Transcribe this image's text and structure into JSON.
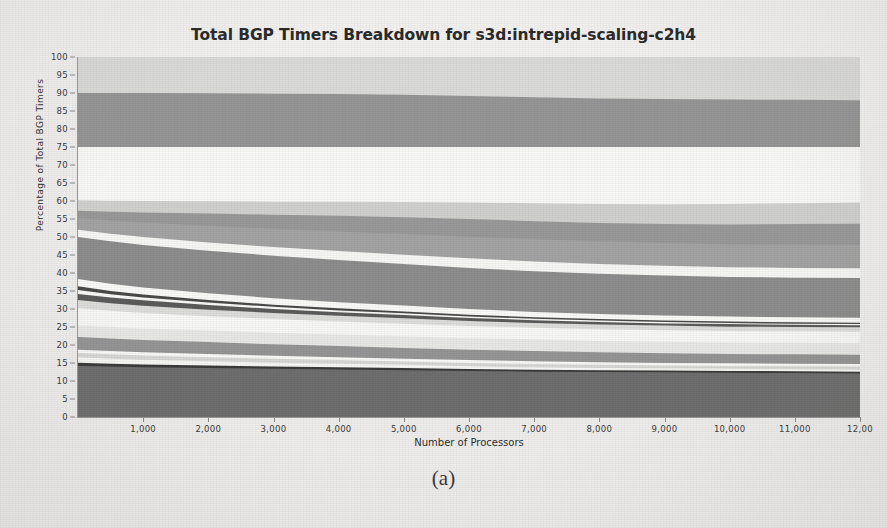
{
  "figure": {
    "caption": "(a)"
  },
  "chart_data": {
    "type": "area",
    "title": "Total BGP Timers Breakdown for s3d:intrepid-scaling-c2h4",
    "xlabel": "Number of Processors",
    "ylabel": "Percentage of Total BGP Timers",
    "xlim": [
      0,
      12000
    ],
    "ylim": [
      0,
      100
    ],
    "grid": false,
    "legend_position": "none",
    "stacked": true,
    "normalized_percent": true,
    "xticks": [
      {
        "value": 1000,
        "label": "1,000"
      },
      {
        "value": 2000,
        "label": "2,000"
      },
      {
        "value": 3000,
        "label": "3,000"
      },
      {
        "value": 4000,
        "label": "4,000"
      },
      {
        "value": 5000,
        "label": "5,000"
      },
      {
        "value": 6000,
        "label": "6,000"
      },
      {
        "value": 7000,
        "label": "7,000"
      },
      {
        "value": 8000,
        "label": "8,000"
      },
      {
        "value": 9000,
        "label": "9,000"
      },
      {
        "value": 10000,
        "label": "10,000"
      },
      {
        "value": 11000,
        "label": "11,000"
      },
      {
        "value": 12000,
        "label": "12,00"
      }
    ],
    "yticks": [
      {
        "value": 0,
        "label": "0"
      },
      {
        "value": 5,
        "label": "5"
      },
      {
        "value": 10,
        "label": "10"
      },
      {
        "value": 15,
        "label": "15"
      },
      {
        "value": 20,
        "label": "20"
      },
      {
        "value": 25,
        "label": "25"
      },
      {
        "value": 30,
        "label": "30"
      },
      {
        "value": 35,
        "label": "35"
      },
      {
        "value": 40,
        "label": "40"
      },
      {
        "value": 45,
        "label": "45"
      },
      {
        "value": 50,
        "label": "50"
      },
      {
        "value": 55,
        "label": "55"
      },
      {
        "value": 60,
        "label": "60"
      },
      {
        "value": 65,
        "label": "65"
      },
      {
        "value": 70,
        "label": "70"
      },
      {
        "value": 75,
        "label": "75"
      },
      {
        "value": 80,
        "label": "80"
      },
      {
        "value": 85,
        "label": "85"
      },
      {
        "value": 90,
        "label": "90"
      },
      {
        "value": 95,
        "label": "95"
      },
      {
        "value": 100,
        "label": "100"
      }
    ],
    "x": [
      0,
      500,
      1000,
      2000,
      3000,
      4000,
      5000,
      6000,
      7000,
      8000,
      9000,
      10000,
      11000,
      12000
    ],
    "series": [
      {
        "name": "band-01-bottom-dark",
        "color": "#6f6f6f",
        "cumulative_top": [
          14.2,
          14.0,
          13.8,
          13.6,
          13.4,
          13.2,
          13.0,
          12.8,
          12.6,
          12.5,
          12.4,
          12.3,
          12.2,
          12.1
        ]
      },
      {
        "name": "band-02-darkline",
        "color": "#3b3b3b",
        "cumulative_top": [
          15.1,
          14.8,
          14.6,
          14.3,
          14.0,
          13.8,
          13.6,
          13.3,
          13.1,
          13.0,
          12.9,
          12.8,
          12.7,
          12.6
        ]
      },
      {
        "name": "band-03-white",
        "color": "#f7f7f5",
        "cumulative_top": [
          16.6,
          16.2,
          15.9,
          15.5,
          15.1,
          14.8,
          14.5,
          14.1,
          13.8,
          13.6,
          13.5,
          13.4,
          13.3,
          13.2
        ]
      },
      {
        "name": "band-04-light",
        "color": "#d8d8d6",
        "cumulative_top": [
          17.8,
          17.4,
          17.1,
          16.6,
          16.2,
          15.8,
          15.4,
          15.0,
          14.7,
          14.5,
          14.3,
          14.2,
          14.1,
          14.0
        ]
      },
      {
        "name": "band-05-white",
        "color": "#fafaf8",
        "cumulative_top": [
          18.7,
          18.3,
          18.0,
          17.5,
          17.0,
          16.6,
          16.2,
          15.8,
          15.5,
          15.2,
          15.0,
          14.9,
          14.8,
          14.7
        ]
      },
      {
        "name": "band-06-medium",
        "color": "#969696",
        "cumulative_top": [
          22.2,
          21.8,
          21.4,
          20.8,
          20.2,
          19.7,
          19.2,
          18.7,
          18.3,
          18.0,
          17.7,
          17.5,
          17.4,
          17.3
        ]
      },
      {
        "name": "band-07-verylight",
        "color": "#e9e9e7",
        "cumulative_top": [
          25.4,
          25.0,
          24.6,
          24.0,
          23.4,
          22.9,
          22.4,
          21.9,
          21.5,
          21.2,
          20.9,
          20.7,
          20.6,
          20.5
        ]
      },
      {
        "name": "band-08-white",
        "color": "#f9f9f7",
        "cumulative_top": [
          30.2,
          29.5,
          28.9,
          28.0,
          27.2,
          26.5,
          25.9,
          25.3,
          24.8,
          24.4,
          24.1,
          23.9,
          23.8,
          23.7
        ]
      },
      {
        "name": "band-09-palegray",
        "color": "#dededc",
        "cumulative_top": [
          32.5,
          31.6,
          30.9,
          29.8,
          28.9,
          28.1,
          27.4,
          26.7,
          26.1,
          25.7,
          25.4,
          25.1,
          25.0,
          24.9
        ]
      },
      {
        "name": "band-10-darkthin",
        "color": "#5c5c5c",
        "cumulative_top": [
          34.2,
          33.2,
          32.4,
          31.1,
          30.0,
          29.1,
          28.3,
          27.5,
          26.9,
          26.4,
          26.0,
          25.8,
          25.6,
          25.5
        ]
      },
      {
        "name": "band-11-white",
        "color": "#fafaf8",
        "cumulative_top": [
          35.3,
          34.1,
          33.2,
          31.8,
          30.6,
          29.6,
          28.8,
          27.9,
          27.3,
          26.8,
          26.4,
          26.1,
          25.9,
          25.8
        ]
      },
      {
        "name": "band-12-darkline2",
        "color": "#4a4a4a",
        "cumulative_top": [
          36.3,
          35.0,
          34.0,
          32.5,
          31.2,
          30.2,
          29.3,
          28.4,
          27.7,
          27.2,
          26.8,
          26.5,
          26.3,
          26.2
        ]
      },
      {
        "name": "band-13-whiteband",
        "color": "#fbfbf9",
        "cumulative_top": [
          38.3,
          37.0,
          36.0,
          34.4,
          33.0,
          31.9,
          31.0,
          30.0,
          29.2,
          28.6,
          28.2,
          27.9,
          27.7,
          27.6
        ]
      },
      {
        "name": "band-14-bigmedium",
        "color": "#8e8e8e",
        "cumulative_top": [
          50.0,
          48.8,
          47.8,
          46.2,
          44.8,
          43.6,
          42.5,
          41.4,
          40.5,
          39.8,
          39.3,
          38.9,
          38.7,
          38.6
        ]
      },
      {
        "name": "band-15-white",
        "color": "#f8f8f6",
        "cumulative_top": [
          52.0,
          50.9,
          50.0,
          48.5,
          47.2,
          46.1,
          45.1,
          44.1,
          43.2,
          42.5,
          42.0,
          41.6,
          41.4,
          41.3
        ]
      },
      {
        "name": "band-16-medgray",
        "color": "#a4a4a4",
        "cumulative_top": [
          55.3,
          54.6,
          54.0,
          53.1,
          52.3,
          51.5,
          50.8,
          50.1,
          49.4,
          48.8,
          48.3,
          48.0,
          47.9,
          47.8
        ]
      },
      {
        "name": "band-17-medgray2",
        "color": "#9a9a9a",
        "cumulative_top": [
          57.3,
          57.0,
          56.8,
          56.5,
          56.2,
          55.9,
          55.5,
          55.0,
          54.4,
          53.9,
          53.6,
          53.5,
          53.6,
          53.7
        ]
      },
      {
        "name": "band-18-lightgray",
        "color": "#d2d2d0",
        "cumulative_top": [
          60.2,
          60.1,
          60.0,
          59.9,
          59.8,
          59.8,
          59.7,
          59.6,
          59.4,
          59.2,
          59.1,
          59.2,
          59.4,
          59.6
        ]
      },
      {
        "name": "band-19-white",
        "color": "#fafaf8",
        "cumulative_top": [
          75.0,
          75.0,
          75.0,
          75.0,
          75.0,
          75.0,
          75.0,
          75.0,
          75.0,
          75.0,
          75.0,
          75.0,
          75.0,
          75.0
        ]
      },
      {
        "name": "band-20-bigmedium2",
        "color": "#979797",
        "cumulative_top": [
          90.0,
          90.0,
          90.0,
          89.9,
          89.8,
          89.7,
          89.5,
          89.2,
          88.8,
          88.5,
          88.3,
          88.2,
          88.1,
          88.0
        ]
      },
      {
        "name": "band-21-toplight",
        "color": "#dcdcda",
        "cumulative_top": [
          100,
          100,
          100,
          100,
          100,
          100,
          100,
          100,
          100,
          100,
          100,
          100,
          100,
          100
        ]
      }
    ]
  }
}
